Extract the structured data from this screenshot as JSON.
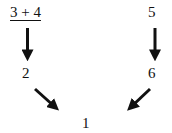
{
  "nodes": {
    "top_left": {
      "text": "3 + 4",
      "underlined": true
    },
    "top_right": {
      "text": "5"
    },
    "mid_left": {
      "text": "2"
    },
    "mid_right": {
      "text": "6"
    },
    "bottom": {
      "text": "1"
    }
  },
  "edges": [
    {
      "from": "top_left",
      "to": "mid_left"
    },
    {
      "from": "top_right",
      "to": "mid_right"
    },
    {
      "from": "mid_left",
      "to": "bottom"
    },
    {
      "from": "mid_right",
      "to": "bottom"
    }
  ],
  "colors": {
    "arrow": "#111111",
    "text": "#111111",
    "background": "#ffffff"
  }
}
